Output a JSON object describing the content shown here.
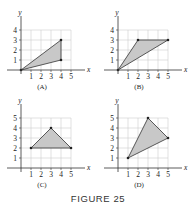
{
  "figure": {
    "caption": "FIGURE 25"
  },
  "panels": [
    {
      "label": "(A)",
      "origin": [
        21,
        70
      ],
      "xmax": 5,
      "ymax": 4,
      "xticks": [
        "1",
        "2",
        "3",
        "4",
        "5"
      ],
      "yticks": [
        "1",
        "2",
        "3",
        "4"
      ],
      "vertices": [
        [
          0,
          0
        ],
        [
          4,
          3
        ],
        [
          4,
          1
        ]
      ]
    },
    {
      "label": "(B)",
      "origin": [
        118,
        70
      ],
      "xmax": 5,
      "ymax": 4,
      "xticks": [
        "1",
        "2",
        "3",
        "4",
        "5"
      ],
      "yticks": [
        "1",
        "2",
        "3",
        "4"
      ],
      "vertices": [
        [
          0,
          0
        ],
        [
          2,
          3
        ],
        [
          5,
          3
        ]
      ]
    },
    {
      "label": "(C)",
      "origin": [
        21,
        168
      ],
      "xmax": 5,
      "ymax": 5,
      "xticks": [
        "1",
        "2",
        "3",
        "4",
        "5"
      ],
      "yticks": [
        "1",
        "2",
        "3",
        "4",
        "5"
      ],
      "vertices": [
        [
          1,
          2
        ],
        [
          3,
          4
        ],
        [
          5,
          2
        ]
      ]
    },
    {
      "label": "(D)",
      "origin": [
        118,
        168
      ],
      "xmax": 5,
      "ymax": 5,
      "xticks": [
        "1",
        "2",
        "3",
        "4",
        "5"
      ],
      "yticks": [
        "1",
        "2",
        "3",
        "4",
        "5"
      ],
      "vertices": [
        [
          1,
          1
        ],
        [
          3,
          5
        ],
        [
          5,
          3
        ]
      ]
    }
  ],
  "axis_labels": {
    "x": "x",
    "y": "y"
  },
  "colors": {
    "fill": "#c8c8c8",
    "grid": "#cfcfcf",
    "line": "#333333"
  }
}
